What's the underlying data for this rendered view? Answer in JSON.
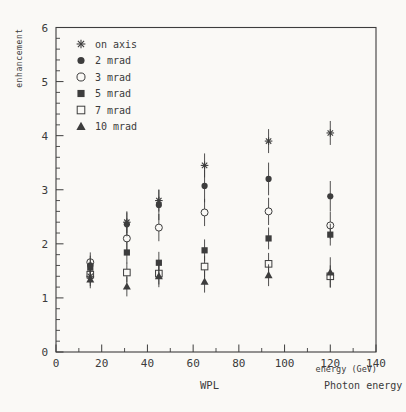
{
  "page": {
    "background": "#faf9f6",
    "ink_color": "#3d3d3d"
  },
  "chart_data": {
    "type": "scatter",
    "title": "",
    "ylabel": "enhancement",
    "xlabel": "energy (GeV)",
    "xlabel_line2": "Photon energy",
    "footer_left": "WPL",
    "xlim": [
      0,
      140
    ],
    "ylim": [
      0,
      6
    ],
    "x_tick_labels": [
      "0",
      "20",
      "40",
      "60",
      "80",
      "100",
      "120",
      "140"
    ],
    "x_major_ticks": [
      0,
      20,
      40,
      60,
      80,
      100,
      120,
      140
    ],
    "x_minor_step": 10,
    "y_tick_labels": [
      "0",
      "1",
      "2",
      "3",
      "4",
      "5",
      "6"
    ],
    "y_major_ticks": [
      0,
      1,
      2,
      3,
      4,
      5,
      6
    ],
    "y_minor_step": 0.2,
    "grid": false,
    "legend_position": "top-left",
    "error_bars": true,
    "x": [
      15,
      31,
      45,
      65,
      93,
      120
    ],
    "series": [
      {
        "name": "on axis",
        "marker": "asterisk",
        "values": [
          1.4,
          2.4,
          2.8,
          3.45,
          3.9,
          4.05
        ],
        "errors": [
          0.08,
          0.1,
          0.1,
          0.12,
          0.12,
          0.12
        ]
      },
      {
        "name": "2 mrad",
        "marker": "circle-filled",
        "values": [
          1.6,
          2.36,
          2.72,
          3.07,
          3.2,
          2.88
        ],
        "errors": [
          0.08,
          0.12,
          0.18,
          0.2,
          0.2,
          0.18
        ]
      },
      {
        "name": "3 mrad",
        "marker": "circle-open",
        "values": [
          1.66,
          2.1,
          2.3,
          2.58,
          2.6,
          2.34
        ],
        "errors": [
          0.08,
          0.12,
          0.15,
          0.15,
          0.15,
          0.15
        ]
      },
      {
        "name": "5 mrad",
        "marker": "square-filled",
        "values": [
          1.56,
          1.84,
          1.65,
          1.88,
          2.1,
          2.17
        ],
        "errors": [
          0.06,
          0.1,
          0.1,
          0.1,
          0.1,
          0.1
        ]
      },
      {
        "name": "7 mrad",
        "marker": "square-open",
        "values": [
          1.43,
          1.47,
          1.45,
          1.58,
          1.63,
          1.4
        ],
        "errors": [
          0.06,
          0.08,
          0.1,
          0.1,
          0.1,
          0.1
        ]
      },
      {
        "name": "10 mrad",
        "marker": "triangle-filled",
        "values": [
          1.34,
          1.21,
          1.4,
          1.3,
          1.42,
          1.47
        ],
        "errors": [
          0.06,
          0.08,
          0.1,
          0.1,
          0.1,
          0.18
        ]
      }
    ]
  }
}
